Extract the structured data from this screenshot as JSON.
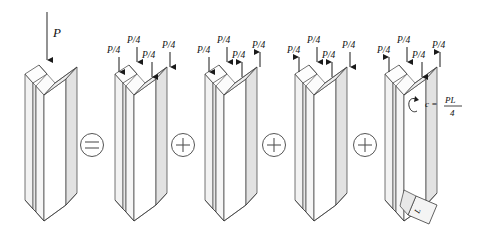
{
  "figure": {
    "type": "engineering-superposition-diagram",
    "background_color": "#ffffff",
    "line_color": "#3a3a3a",
    "face_light": "#ffffff",
    "face_mid": "#f2f2f2",
    "face_dark": "#e2e2e2",
    "text_color": "#111111"
  },
  "labels": {
    "main_load": "P",
    "quarter_load": "P/4",
    "couple": "c =",
    "couple_numerator": "PL",
    "couple_denominator": "4",
    "length": "L"
  },
  "operators": [
    {
      "name": "equals",
      "glyph": "=",
      "x": 92
    },
    {
      "name": "plus",
      "glyph": "+",
      "x": 183
    },
    {
      "name": "plus",
      "glyph": "+",
      "x": 274
    },
    {
      "name": "plus",
      "glyph": "+",
      "x": 365
    }
  ],
  "beams": [
    {
      "index": 0,
      "name": "original-loaded-beam",
      "origin_x": 25,
      "loads": [
        {
          "label": "P",
          "direction": "down",
          "long": true
        }
      ]
    },
    {
      "index": 1,
      "name": "axial-compression-case",
      "origin_x": 115,
      "loads": [
        {
          "label": "P/4",
          "direction": "down"
        },
        {
          "label": "P/4",
          "direction": "down"
        },
        {
          "label": "P/4",
          "direction": "down"
        },
        {
          "label": "P/4",
          "direction": "down"
        }
      ]
    },
    {
      "index": 2,
      "name": "bending-case-one",
      "origin_x": 205,
      "loads": [
        {
          "label": "P/4",
          "direction": "down"
        },
        {
          "label": "P/4",
          "direction": "down"
        },
        {
          "label": "P/4",
          "direction": "up"
        },
        {
          "label": "P/4",
          "direction": "up"
        }
      ]
    },
    {
      "index": 3,
      "name": "bending-case-two",
      "origin_x": 295,
      "loads": [
        {
          "label": "P/4",
          "direction": "up"
        },
        {
          "label": "P/4",
          "direction": "down"
        },
        {
          "label": "P/4",
          "direction": "up"
        },
        {
          "label": "P/4",
          "direction": "down"
        }
      ]
    },
    {
      "index": 4,
      "name": "torsion-case",
      "origin_x": 385,
      "twisted_base": true,
      "loads": [
        {
          "label": "P/4",
          "direction": "up"
        },
        {
          "label": "P/4",
          "direction": "down"
        },
        {
          "label": "P/4",
          "direction": "down"
        },
        {
          "label": "P/4",
          "direction": "up"
        }
      ]
    }
  ]
}
